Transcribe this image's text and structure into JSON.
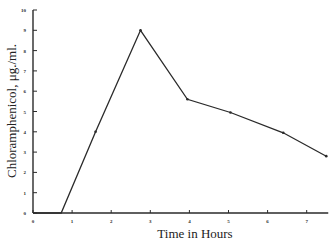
{
  "chart_data": {
    "type": "line",
    "title": "",
    "xlabel": "Time in Hours",
    "ylabel": "Chloramphenicol, μg./ml.",
    "xlim": [
      0,
      7.5
    ],
    "ylim": [
      0,
      10
    ],
    "xticks": [
      "0",
      "1",
      "2",
      "3",
      "4",
      "5",
      "6",
      "7"
    ],
    "yticks": [
      "0",
      "1",
      "2",
      "3",
      "4",
      "5",
      "6",
      "7",
      "8",
      "9",
      "10"
    ],
    "grid": false,
    "legend": null,
    "series": [
      {
        "name": "Chloramphenicol concentration",
        "x": [
          0,
          0.72,
          1.6,
          2.75,
          3.95,
          5.05,
          6.4,
          7.5
        ],
        "y": [
          0,
          0,
          4.0,
          9.0,
          5.6,
          4.95,
          3.95,
          2.8
        ]
      }
    ]
  },
  "labels": {
    "xlabel": "Time in Hours",
    "ylabel": "Chloramphenicol, μg./ml."
  },
  "colors": {
    "line": "#2a2a2a",
    "axis": "#2a2a2a",
    "background": "#ffffff"
  }
}
